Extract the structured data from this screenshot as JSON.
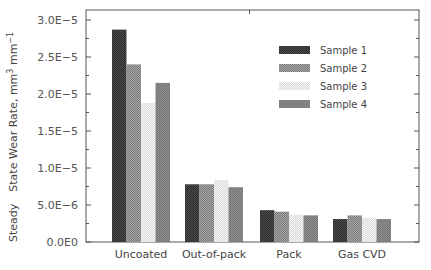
{
  "chart_data": {
    "type": "bar",
    "title": "",
    "xlabel": "",
    "ylabel_parts": [
      "Steady",
      "State Wear Rate, mm",
      "3",
      " mm",
      "−1"
    ],
    "ylabel": "Steady State Wear Rate, mm3 mm-1",
    "categories": [
      "Uncoated",
      "Out-of-pack",
      "Pack",
      "Gas CVD"
    ],
    "series": [
      {
        "name": "Sample 1",
        "color": "#4a4a4a",
        "values": [
          2.87e-05,
          7.8e-06,
          4.3e-06,
          3.1e-06
        ]
      },
      {
        "name": "Sample 2",
        "color": "#a9a9a9",
        "values": [
          2.4e-05,
          7.8e-06,
          4.1e-06,
          3.6e-06
        ]
      },
      {
        "name": "Sample 3",
        "color": "#dcdcdc",
        "values": [
          1.88e-05,
          8.4e-06,
          3.7e-06,
          3.3e-06
        ]
      },
      {
        "name": "Sample 4",
        "color": "#8c8c8c",
        "values": [
          2.15e-05,
          7.4e-06,
          3.6e-06,
          3.1e-06
        ]
      }
    ],
    "ylim": [
      0,
      3.2e-05
    ],
    "yticks": [
      0,
      5e-06,
      1e-05,
      1.5e-05,
      2e-05,
      2.5e-05,
      3e-05
    ],
    "ytick_labels": [
      "0.0E0",
      "5.0E−6",
      "1.0E−5",
      "1.5E−5",
      "2.0E−5",
      "2.5E−5",
      "3.0E−5"
    ],
    "minor_yticks": true,
    "grid": false,
    "legend_position": "top-right",
    "frame_color": "#555555"
  }
}
